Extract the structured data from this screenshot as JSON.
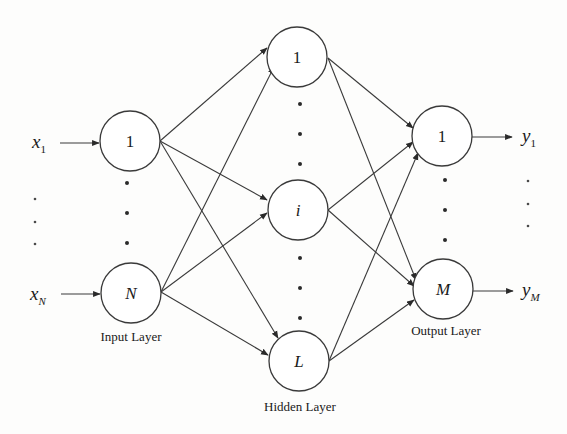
{
  "diagram": {
    "colors": {
      "line": "#3a3a3a",
      "node_fill": "#ffffff",
      "text": "#1a1a1a",
      "background": "#fdfdfc"
    },
    "inputs": [
      {
        "name": "x",
        "sub": "1",
        "sub_italic": false
      },
      {
        "name": "x",
        "sub": "N",
        "sub_italic": true
      }
    ],
    "outputs": [
      {
        "name": "y",
        "sub": "1",
        "sub_italic": false
      },
      {
        "name": "y",
        "sub": "M",
        "sub_italic": true
      }
    ],
    "layers": {
      "input": {
        "label": "Input Layer",
        "nodes": [
          "1",
          "N"
        ]
      },
      "hidden": {
        "label": "Hidden Layer",
        "nodes": [
          "1",
          "i",
          "L"
        ]
      },
      "output": {
        "label": "Output Layer",
        "nodes": [
          "1",
          "M"
        ]
      }
    },
    "ellipsis": "⋮",
    "edges": [
      {
        "from": "input.1",
        "to": "hidden.1"
      },
      {
        "from": "input.1",
        "to": "hidden.i"
      },
      {
        "from": "input.1",
        "to": "hidden.L"
      },
      {
        "from": "input.N",
        "to": "hidden.1"
      },
      {
        "from": "input.N",
        "to": "hidden.i"
      },
      {
        "from": "input.N",
        "to": "hidden.L"
      },
      {
        "from": "hidden.1",
        "to": "output.1"
      },
      {
        "from": "hidden.1",
        "to": "output.M"
      },
      {
        "from": "hidden.i",
        "to": "output.1"
      },
      {
        "from": "hidden.i",
        "to": "output.M"
      },
      {
        "from": "hidden.L",
        "to": "output.1"
      },
      {
        "from": "hidden.L",
        "to": "output.M"
      }
    ]
  }
}
